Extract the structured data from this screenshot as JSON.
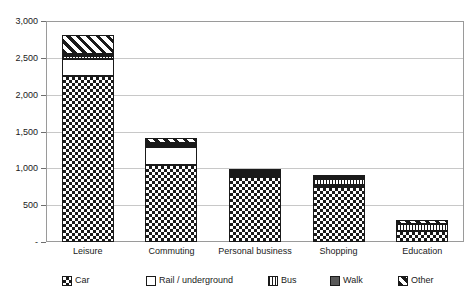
{
  "chart_data": {
    "type": "bar",
    "subtype": "stacked-bar",
    "title": "",
    "subtitle": "",
    "xlabel": "",
    "ylabel": "",
    "categories": [
      "Leisure",
      "Commuting",
      "Personal business",
      "Shopping",
      "Education"
    ],
    "series": [
      {
        "name": "Car",
        "pattern": "checkerboard",
        "values": [
          2270,
          1060,
          930,
          790,
          150
        ]
      },
      {
        "name": "Rail / underground",
        "pattern": "solid-white",
        "values": [
          230,
          250,
          20,
          15,
          0
        ]
      },
      {
        "name": "Bus",
        "pattern": "vertical-stripes",
        "values": [
          40,
          30,
          25,
          80,
          100
        ]
      },
      {
        "name": "Walk",
        "pattern": "solid-dark-gray",
        "values": [
          15,
          10,
          10,
          15,
          0
        ]
      },
      {
        "name": "Other",
        "pattern": "diagonal-stripes",
        "values": [
          250,
          60,
          10,
          10,
          45
        ]
      }
    ],
    "totals": [
      2805,
      1410,
      995,
      910,
      295
    ],
    "ylim": [
      0,
      3000
    ],
    "y_ticks": [
      0,
      500,
      1000,
      1500,
      2000,
      2500,
      3000
    ],
    "y_tick_labels": [
      "-",
      "500",
      "1,000",
      "1,500",
      "2,000",
      "2,500",
      "3,000"
    ],
    "grid": true,
    "grid_axis": "y",
    "legend_position": "bottom",
    "colors": {
      "ink": "#1a1a1a",
      "gridline": "#c8c8c8",
      "frame": "#9a9a9a",
      "walk_fill": "#595959",
      "background": "#ffffff"
    }
  },
  "legend": {
    "items": [
      {
        "label": "Car",
        "swatch": "pat-car"
      },
      {
        "label": "Rail / underground",
        "swatch": "pat-rail"
      },
      {
        "label": "Bus",
        "swatch": "pat-bus"
      },
      {
        "label": "Walk",
        "swatch": "pat-walk"
      },
      {
        "label": "Other",
        "swatch": "pat-other"
      }
    ]
  }
}
